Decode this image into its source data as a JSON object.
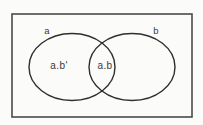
{
  "diagram": {
    "type": "venn",
    "universe": {
      "name": "universe-rectangle",
      "shape": "rectangle",
      "x": 12,
      "y": 14,
      "width": 180,
      "height": 103,
      "stroke": "#4a4a4a",
      "stroke_width": 1.6,
      "fill": "none"
    },
    "background_color": "#fbfbfa",
    "stroke_color": "#2f2f2f",
    "text_color": "#3a3a3a",
    "sets": [
      {
        "id": "set-a",
        "label": "a",
        "label_x": 47,
        "label_y": 31,
        "cx": 72,
        "cy": 67,
        "rx": 43,
        "ry": 33.5,
        "stroke": "#2f2f2f",
        "stroke_width": 1.4,
        "fill": "none"
      },
      {
        "id": "set-b",
        "label": "b",
        "label_x": 156,
        "label_y": 31,
        "cx": 132,
        "cy": 67,
        "rx": 43,
        "ry": 33.5,
        "stroke": "#2f2f2f",
        "stroke_width": 1.4,
        "fill": "none"
      }
    ],
    "regions": [
      {
        "id": "region-a-not-b",
        "label": "a.b'",
        "description": "a AND NOT b",
        "x": 59,
        "y": 66
      },
      {
        "id": "region-a-and-b",
        "label": "a.b",
        "description": "a AND b",
        "x": 105,
        "y": 66
      }
    ]
  }
}
